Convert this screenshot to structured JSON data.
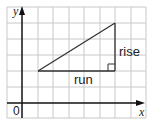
{
  "diagram": {
    "axes": {
      "x_label": "x",
      "y_label": "y",
      "origin_label": "0"
    },
    "triangle": {
      "run_label": "run",
      "rise_label": "rise"
    },
    "colors": {
      "grid": "#c8c8c8",
      "axis": "#111111",
      "line": "#333333"
    }
  }
}
